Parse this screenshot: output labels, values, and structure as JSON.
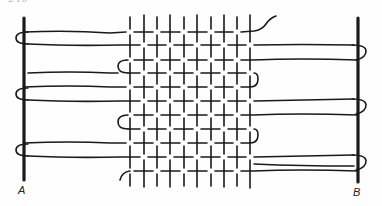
{
  "page": {
    "number": "246"
  },
  "diagram": {
    "ink_color": "#1a1a1a",
    "background_color": "#ffffff",
    "labels": {
      "left_bar": "A",
      "right_bar": "B"
    },
    "left_bar": {
      "x": 24,
      "y1": 18,
      "y2": 180
    },
    "right_bar": {
      "x": 358,
      "y1": 18,
      "y2": 182
    },
    "warp_count": 10,
    "warp_x": [
      130,
      144,
      157,
      170,
      184,
      197,
      211,
      224,
      237,
      250
    ],
    "warp_y": [
      16,
      187
    ],
    "weft_count": 11,
    "weft_y": [
      32,
      45,
      60,
      73,
      87,
      101,
      115,
      129,
      143,
      157,
      171
    ]
  }
}
